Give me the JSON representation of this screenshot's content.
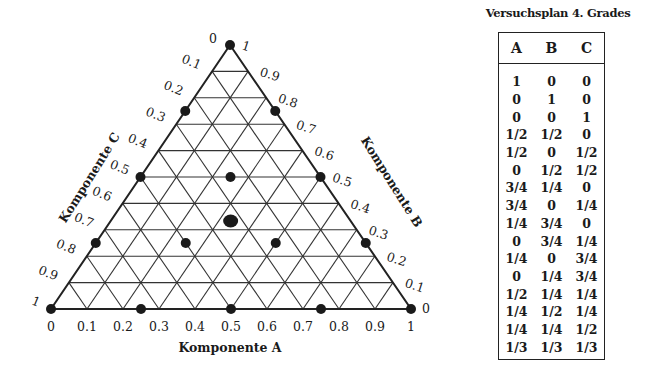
{
  "chart_data": {
    "type": "scatter",
    "subtype": "ternary",
    "title": "",
    "axes": {
      "A": {
        "label": "Komponente A",
        "side": "bottom",
        "ticks": [
          "0",
          "0.1",
          "0.2",
          "0.3",
          "0.4",
          "0.5",
          "0.6",
          "0.7",
          "0.8",
          "0.9",
          "1"
        ]
      },
      "B": {
        "label": "Komponente B",
        "side": "right",
        "ticks": [
          "0",
          "0.1",
          "0.2",
          "0.3",
          "0.4",
          "0.5",
          "0.6",
          "0.7",
          "0.8",
          "0.9",
          "1"
        ]
      },
      "C": {
        "label": "Komponente C",
        "side": "left",
        "ticks": [
          "0",
          "0.1",
          "0.2",
          "0.3",
          "0.4",
          "0.5",
          "0.6",
          "0.7",
          "0.8",
          "0.9",
          "1"
        ]
      }
    },
    "grid": true,
    "grid_step": 0.1,
    "points": [
      {
        "A": 1,
        "B": 0,
        "C": 0
      },
      {
        "A": 0,
        "B": 1,
        "C": 0
      },
      {
        "A": 0,
        "B": 0,
        "C": 1
      },
      {
        "A": 0.5,
        "B": 0.5,
        "C": 0
      },
      {
        "A": 0.5,
        "B": 0,
        "C": 0.5
      },
      {
        "A": 0,
        "B": 0.5,
        "C": 0.5
      },
      {
        "A": 0.75,
        "B": 0.25,
        "C": 0
      },
      {
        "A": 0.75,
        "B": 0,
        "C": 0.25
      },
      {
        "A": 0.25,
        "B": 0.75,
        "C": 0
      },
      {
        "A": 0,
        "B": 0.75,
        "C": 0.25
      },
      {
        "A": 0.25,
        "B": 0,
        "C": 0.75
      },
      {
        "A": 0,
        "B": 0.25,
        "C": 0.75
      },
      {
        "A": 0.5,
        "B": 0.25,
        "C": 0.25
      },
      {
        "A": 0.25,
        "B": 0.5,
        "C": 0.25
      },
      {
        "A": 0.25,
        "B": 0.25,
        "C": 0.5
      },
      {
        "A": 0.3333,
        "B": 0.3333,
        "C": 0.3333,
        "emphasized": true
      }
    ]
  },
  "table": {
    "title": "Versuchsplan 4. Grades",
    "headers": [
      "A",
      "B",
      "C"
    ],
    "rows": [
      [
        "1",
        "0",
        "0"
      ],
      [
        "0",
        "1",
        "0"
      ],
      [
        "0",
        "0",
        "1"
      ],
      [
        "1/2",
        "1/2",
        "0"
      ],
      [
        "1/2",
        "0",
        "1/2"
      ],
      [
        "0",
        "1/2",
        "1/2"
      ],
      [
        "3/4",
        "1/4",
        "0"
      ],
      [
        "3/4",
        "0",
        "1/4"
      ],
      [
        "1/4",
        "3/4",
        "0"
      ],
      [
        "0",
        "3/4",
        "1/4"
      ],
      [
        "1/4",
        "0",
        "3/4"
      ],
      [
        "0",
        "1/4",
        "3/4"
      ],
      [
        "1/2",
        "1/4",
        "1/4"
      ],
      [
        "1/4",
        "1/2",
        "1/4"
      ],
      [
        "1/4",
        "1/4",
        "1/2"
      ],
      [
        "1/3",
        "1/3",
        "1/3"
      ]
    ]
  },
  "colors": {
    "ink": "#1a1a1a",
    "grid": "#333333",
    "background": "#ffffff"
  }
}
